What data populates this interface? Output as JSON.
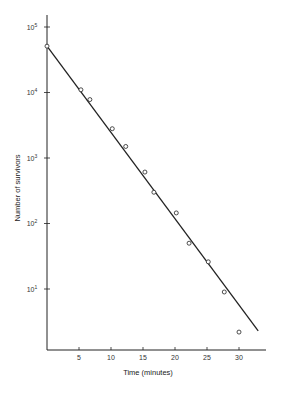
{
  "chart_data": {
    "type": "scatter",
    "title": "",
    "xlabel": "Time (minutes)",
    "ylabel": "Number of survivors",
    "yscale": "log",
    "xlim": [
      0,
      34
    ],
    "ylim": [
      1,
      100000
    ],
    "grid": false,
    "legend": null,
    "x_ticks": [
      5,
      10,
      15,
      20,
      25,
      30
    ],
    "x_tick_labels": [
      "5",
      "10",
      "15",
      "20",
      "25",
      "30"
    ],
    "y_ticks": [
      100000,
      10000,
      1000,
      100,
      10
    ],
    "y_tick_labels": [
      {
        "base": "10",
        "exp": "5"
      },
      {
        "base": "10",
        "exp": "4"
      },
      {
        "base": "10",
        "exp": "3"
      },
      {
        "base": "10",
        "exp": "2"
      },
      {
        "base": "10",
        "exp": "1"
      }
    ],
    "series": [
      {
        "name": "observed survivors",
        "style": "open-circle markers",
        "x": [
          0,
          5.3,
          6.7,
          10.2,
          12.3,
          15.3,
          16.7,
          20.2,
          22.2,
          25.2,
          27.7,
          30
        ],
        "y": [
          51000,
          11000,
          7800,
          2800,
          1500,
          610,
          300,
          145,
          50,
          26,
          9,
          2.2
        ]
      },
      {
        "name": "fitted exponential decay",
        "style": "solid line",
        "x": [
          0,
          33
        ],
        "y": [
          51000,
          2.3
        ]
      }
    ]
  },
  "color": {
    "ink": "#222222",
    "background": "#ffffff"
  }
}
